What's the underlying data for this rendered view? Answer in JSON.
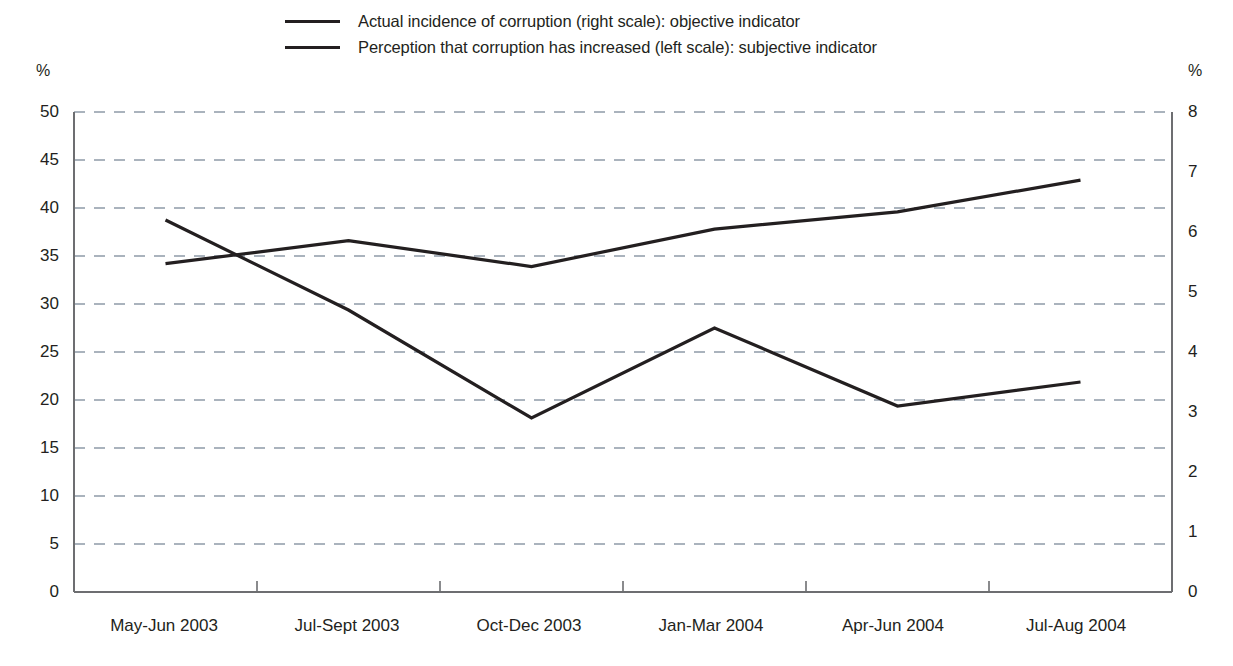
{
  "legend": {
    "items": [
      {
        "label": "Actual incidence of corruption (right scale): objective indicator",
        "series": "objective"
      },
      {
        "label": "Perception that corruption has increased (left scale): subjective indicator",
        "series": "subjective"
      }
    ]
  },
  "axes": {
    "left_unit": "%",
    "right_unit": "%",
    "left_ticks": [
      "50",
      "45",
      "40",
      "35",
      "30",
      "25",
      "20",
      "15",
      "10",
      "5",
      "0"
    ],
    "right_ticks": [
      "8",
      "7",
      "6",
      "5",
      "4",
      "3",
      "2",
      "1",
      "0"
    ]
  },
  "chart_data": {
    "type": "line",
    "title": "",
    "xlabel": "",
    "ylabel": "%",
    "categories": [
      "May-Jun 2003",
      "Jul-Sept 2003",
      "Oct-Dec 2003",
      "Jan-Mar 2004",
      "Apr-Jun 2004",
      "Jul-Aug 2004"
    ],
    "series": [
      {
        "name": "Actual incidence of corruption (right scale): objective indicator",
        "axis": "right",
        "values": [
          6.2,
          4.7,
          2.9,
          4.4,
          3.1,
          3.5
        ],
        "values_left_scale_equivalent": [
          38.5,
          29.3,
          18.2,
          27.6,
          19.6,
          22.1
        ],
        "color": "#231f20"
      },
      {
        "name": "Perception that corruption has increased (left scale): subjective indicator",
        "axis": "left",
        "values": [
          34.2,
          36.6,
          33.9,
          37.8,
          39.6,
          42.9
        ],
        "color": "#231f20"
      }
    ],
    "ylim_left": [
      0,
      50
    ],
    "ylim_right": [
      0,
      8
    ],
    "grid": true,
    "grid_style": "dashed-horizontal",
    "legend_position": "top"
  }
}
